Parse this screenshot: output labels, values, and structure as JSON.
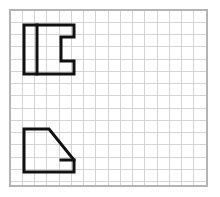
{
  "figure": {
    "canvas": {
      "width": 220,
      "height": 197,
      "background_color": "#ffffff"
    },
    "grid": {
      "name": "graph-paper-grid",
      "origin_x": 10,
      "origin_y": 10,
      "width": 197,
      "height": 176,
      "cell_size": 12.25,
      "columns": 16,
      "rows": 14,
      "line_color": "#c9c9c9",
      "line_width": 0.8,
      "border_color": "#b4b4b4",
      "border_width": 1.4,
      "background_color": "#ffffff"
    },
    "shapes": [
      {
        "name": "upper-shape",
        "label": "notched-rectangle",
        "stroke_color": "#111111",
        "stroke_width": 3,
        "fill": "none",
        "outline_points": "24,25 74,25 74,37 61,37 61,61 74,61 74,74 24,74",
        "interior_lines": [
          {
            "name": "upper-shape-divider",
            "x1": 37,
            "y1": 25,
            "x2": 37,
            "y2": 74
          }
        ],
        "bounds": {
          "x": 24,
          "y": 25,
          "width": 50,
          "height": 49
        }
      },
      {
        "name": "lower-shape",
        "label": "notched-trapezoid",
        "stroke_color": "#111111",
        "stroke_width": 3,
        "fill": "none",
        "outline_points": "24,129 49,129 74,160 74,172 24,172",
        "interior_lines": [
          {
            "name": "lower-shape-notch-edge",
            "x1": 61,
            "y1": 160,
            "x2": 74,
            "y2": 160
          }
        ],
        "bounds": {
          "x": 24,
          "y": 129,
          "width": 50,
          "height": 43
        }
      }
    ]
  }
}
